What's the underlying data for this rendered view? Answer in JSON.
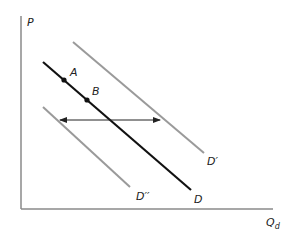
{
  "diagram": {
    "type": "demand-shift",
    "axes": {
      "y_label": "P",
      "x_label": "Q",
      "x_label_subscript": "d",
      "origin": [
        21,
        209
      ],
      "y_top": [
        21,
        16
      ],
      "x_end": [
        273,
        209
      ],
      "color": "#8a8a8a"
    },
    "curves": [
      {
        "id": "D",
        "label": "D",
        "from": [
          43,
          62
        ],
        "to": [
          191,
          190
        ],
        "color": "#111111",
        "width": 2.2,
        "label_pos": [
          194,
          203
        ]
      },
      {
        "id": "D_prime",
        "label": "D′",
        "from": [
          73,
          42
        ],
        "to": [
          204,
          153
        ],
        "color": "#9a9a9a",
        "width": 2,
        "label_pos": [
          207,
          165
        ]
      },
      {
        "id": "D_double_prime",
        "label": "D′′",
        "from": [
          43,
          107
        ],
        "to": [
          130,
          187
        ],
        "color": "#9a9a9a",
        "width": 2,
        "label_pos": [
          136,
          200
        ]
      }
    ],
    "points": [
      {
        "label": "A",
        "pos": [
          64,
          80
        ],
        "label_pos": [
          70,
          76
        ]
      },
      {
        "label": "B",
        "pos": [
          87,
          100
        ],
        "label_pos": [
          92,
          95
        ]
      }
    ],
    "shift_arrow": {
      "from": [
        60,
        120
      ],
      "to": [
        160,
        120
      ],
      "color": "#222222",
      "bidirectional": true
    }
  }
}
